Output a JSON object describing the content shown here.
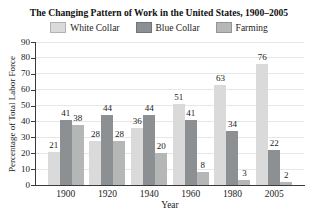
{
  "title": "The Changing Pattern of Work in the United States, 1900–2005",
  "colors": {
    "background": "#ffffff",
    "axis": "#3a3a3a",
    "gridline": "#e7e7e7",
    "text": "#222222"
  },
  "chart_data": {
    "type": "bar",
    "title": "The Changing Pattern of Work in the United States, 1900–2005",
    "categories": [
      "1900",
      "1920",
      "1940",
      "1960",
      "1980",
      "2005"
    ],
    "series": [
      {
        "name": "White Collar",
        "color": "#d9dad9",
        "values": [
          21,
          28,
          36,
          51,
          63,
          76
        ]
      },
      {
        "name": "Blue Collar",
        "color": "#8d9092",
        "values": [
          41,
          44,
          44,
          41,
          34,
          22
        ]
      },
      {
        "name": "Farming",
        "color": "#b5b7b6",
        "values": [
          38,
          28,
          20,
          8,
          3,
          2
        ]
      }
    ],
    "xlabel": "Year",
    "ylabel": "Percentage of Total Labor Force",
    "ylim": [
      0,
      90
    ],
    "yticks": [
      0,
      10,
      20,
      30,
      40,
      50,
      60,
      70,
      80,
      90
    ],
    "grid": true,
    "legend_position": "top",
    "value_labels": true
  }
}
